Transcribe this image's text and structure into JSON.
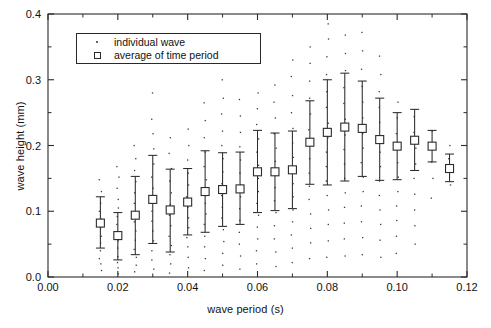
{
  "chart_data": {
    "type": "scatter",
    "title": "",
    "xlabel": "wave period (s)",
    "ylabel": "wave height (mm)",
    "xlim": [
      0.0,
      0.12
    ],
    "ylim": [
      0.0,
      0.4
    ],
    "xticks": [
      0.0,
      0.02,
      0.04,
      0.06,
      0.08,
      0.1,
      0.12
    ],
    "xtick_labels": [
      "0.00",
      "0.02",
      "0.04",
      "0.06",
      "0.08",
      "0.10",
      "0.12"
    ],
    "yticks": [
      0.0,
      0.1,
      0.2,
      0.3,
      0.4
    ],
    "ytick_labels": [
      "0.0",
      "0.1",
      "0.2",
      "0.3",
      "0.4"
    ],
    "minor_xticks": [
      0.01,
      0.03,
      0.05,
      0.07,
      0.09,
      0.11
    ],
    "minor_yticks": [
      0.05,
      0.15,
      0.25,
      0.35
    ],
    "grid": false,
    "legend_position": "upper left",
    "legend": [
      {
        "marker": "dot",
        "label": "individual wave"
      },
      {
        "marker": "square",
        "label": "average of time period"
      }
    ],
    "series": [
      {
        "name": "average of time period",
        "marker": "open-square",
        "error_bars": true,
        "x": [
          0.015,
          0.02,
          0.025,
          0.03,
          0.035,
          0.04,
          0.045,
          0.05,
          0.055,
          0.06,
          0.065,
          0.07,
          0.075,
          0.08,
          0.085,
          0.09,
          0.095,
          0.1,
          0.105,
          0.11,
          0.115
        ],
        "y": [
          0.082,
          0.063,
          0.094,
          0.118,
          0.102,
          0.114,
          0.13,
          0.133,
          0.134,
          0.16,
          0.16,
          0.163,
          0.205,
          0.22,
          0.228,
          0.226,
          0.209,
          0.199,
          0.208,
          0.199,
          0.165
        ],
        "y_lower": [
          0.044,
          0.026,
          0.034,
          0.051,
          0.038,
          0.064,
          0.068,
          0.077,
          0.08,
          0.098,
          0.101,
          0.104,
          0.141,
          0.14,
          0.146,
          0.153,
          0.147,
          0.148,
          0.162,
          0.175,
          0.145
        ],
        "y_upper": [
          0.122,
          0.098,
          0.153,
          0.185,
          0.164,
          0.165,
          0.192,
          0.189,
          0.19,
          0.223,
          0.219,
          0.222,
          0.268,
          0.3,
          0.31,
          0.298,
          0.272,
          0.25,
          0.255,
          0.223,
          0.187
        ]
      },
      {
        "name": "individual wave",
        "marker": "dot",
        "note": "individual wave measurements scattered vertically at each time-period column",
        "columns": [
          {
            "x": 0.015,
            "values": [
              0.01,
              0.02,
              0.028,
              0.04,
              0.052,
              0.062,
              0.075,
              0.088,
              0.1,
              0.112,
              0.13,
              0.148
            ]
          },
          {
            "x": 0.02,
            "values": [
              0.005,
              0.014,
              0.022,
              0.031,
              0.044,
              0.055,
              0.068,
              0.08,
              0.092,
              0.105,
              0.118,
              0.135,
              0.152,
              0.168
            ]
          },
          {
            "x": 0.025,
            "values": [
              0.008,
              0.018,
              0.03,
              0.042,
              0.056,
              0.07,
              0.084,
              0.098,
              0.112,
              0.128,
              0.145,
              0.162,
              0.18,
              0.2
            ]
          },
          {
            "x": 0.03,
            "values": [
              0.012,
              0.026,
              0.04,
              0.055,
              0.07,
              0.085,
              0.1,
              0.118,
              0.135,
              0.152,
              0.172,
              0.195,
              0.218,
              0.24,
              0.28
            ]
          },
          {
            "x": 0.035,
            "values": [
              0.006,
              0.02,
              0.034,
              0.048,
              0.062,
              0.078,
              0.094,
              0.11,
              0.128,
              0.146,
              0.165,
              0.188,
              0.212
            ]
          },
          {
            "x": 0.04,
            "values": [
              0.014,
              0.03,
              0.046,
              0.06,
              0.075,
              0.09,
              0.106,
              0.122,
              0.14,
              0.158,
              0.178,
              0.2,
              0.225
            ]
          },
          {
            "x": 0.045,
            "values": [
              0.01,
              0.028,
              0.046,
              0.062,
              0.08,
              0.096,
              0.112,
              0.13,
              0.148,
              0.168,
              0.19,
              0.212,
              0.238,
              0.265
            ]
          },
          {
            "x": 0.05,
            "values": [
              0.018,
              0.036,
              0.054,
              0.072,
              0.09,
              0.106,
              0.124,
              0.142,
              0.16,
              0.18,
              0.2,
              0.222,
              0.248,
              0.272,
              0.3
            ]
          },
          {
            "x": 0.055,
            "values": [
              0.012,
              0.032,
              0.05,
              0.068,
              0.086,
              0.104,
              0.122,
              0.14,
              0.158,
              0.178,
              0.198,
              0.22,
              0.245,
              0.27
            ]
          },
          {
            "x": 0.06,
            "values": [
              0.02,
              0.04,
              0.058,
              0.076,
              0.094,
              0.112,
              0.13,
              0.15,
              0.17,
              0.19,
              0.21,
              0.232,
              0.256,
              0.28
            ]
          },
          {
            "x": 0.065,
            "values": [
              0.016,
              0.038,
              0.058,
              0.078,
              0.098,
              0.116,
              0.136,
              0.156,
              0.176,
              0.196,
              0.218,
              0.242,
              0.266,
              0.292
            ]
          },
          {
            "x": 0.07,
            "values": [
              0.022,
              0.044,
              0.064,
              0.084,
              0.102,
              0.122,
              0.142,
              0.162,
              0.182,
              0.204,
              0.226,
              0.25,
              0.276,
              0.305,
              0.33
            ]
          },
          {
            "x": 0.075,
            "values": [
              0.028,
              0.052,
              0.074,
              0.096,
              0.118,
              0.138,
              0.158,
              0.18,
              0.202,
              0.224,
              0.248,
              0.272,
              0.298,
              0.325,
              0.35
            ]
          },
          {
            "x": 0.08,
            "values": [
              0.03,
              0.055,
              0.08,
              0.102,
              0.124,
              0.146,
              0.168,
              0.19,
              0.212,
              0.234,
              0.258,
              0.282,
              0.308,
              0.335,
              0.362,
              0.385
            ]
          },
          {
            "x": 0.085,
            "values": [
              0.032,
              0.058,
              0.082,
              0.106,
              0.128,
              0.15,
              0.172,
              0.194,
              0.216,
              0.24,
              0.264,
              0.288,
              0.314,
              0.34,
              0.368
            ]
          },
          {
            "x": 0.09,
            "values": [
              0.034,
              0.06,
              0.084,
              0.108,
              0.13,
              0.152,
              0.174,
              0.196,
              0.218,
              0.242,
              0.266,
              0.29,
              0.316,
              0.344,
              0.372
            ]
          },
          {
            "x": 0.095,
            "values": [
              0.03,
              0.056,
              0.08,
              0.102,
              0.124,
              0.146,
              0.168,
              0.19,
              0.212,
              0.235,
              0.258,
              0.282,
              0.308,
              0.336
            ]
          },
          {
            "x": 0.1,
            "values": [
              0.036,
              0.062,
              0.086,
              0.108,
              0.13,
              0.152,
              0.174,
              0.196,
              0.218,
              0.242,
              0.266
            ]
          },
          {
            "x": 0.105,
            "values": [
              0.05,
              0.078,
              0.102,
              0.126,
              0.15,
              0.172,
              0.196,
              0.22,
              0.244
            ]
          },
          {
            "x": 0.11,
            "values": [
              0.12,
              0.15,
              0.175,
              0.2,
              0.222
            ]
          },
          {
            "x": 0.115,
            "values": [
              0.14,
              0.16,
              0.18,
              0.2
            ]
          }
        ]
      }
    ]
  }
}
